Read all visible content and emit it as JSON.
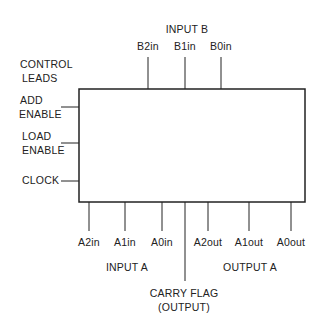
{
  "diagram": {
    "input_b": {
      "title": "INPUT  B",
      "pins": [
        {
          "label": "B2in",
          "x": 148
        },
        {
          "label": "B1in",
          "x": 185
        },
        {
          "label": "B0in",
          "x": 221
        }
      ]
    },
    "control": {
      "title_line1": "CONTROL",
      "title_line2": "LEADS",
      "leads": [
        {
          "line1": "ADD",
          "line2": "ENABLE",
          "y": 107
        },
        {
          "line1": "LOAD",
          "line2": "ENABLE",
          "y": 143
        },
        {
          "line1": "CLOCK",
          "line2": "",
          "y": 181
        }
      ]
    },
    "input_a": {
      "title": "INPUT A",
      "pins": [
        {
          "label": "A2in",
          "x": 89
        },
        {
          "label": "A1in",
          "x": 125
        },
        {
          "label": "A0in",
          "x": 162
        }
      ]
    },
    "output_a": {
      "title": "OUTPUT A",
      "pins": [
        {
          "label": "A2out",
          "x": 208
        },
        {
          "label": "A1out",
          "x": 249
        },
        {
          "label": "A0out",
          "x": 291
        }
      ]
    },
    "carry": {
      "line1": "CARRY  FLAG",
      "line2": "(OUTPUT)",
      "x": 185
    },
    "line_color": "#222222"
  }
}
